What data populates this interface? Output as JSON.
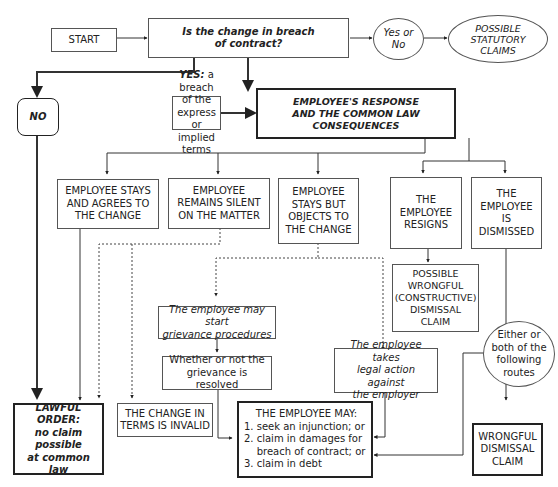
{
  "diagram": {
    "nodes": {
      "start": "START",
      "question": "Is the change in breach\nof contract?",
      "yes_or_no": "Yes or\nNo",
      "statutory": "POSSIBLE\nSTATUTORY\nCLAIMS",
      "no": "NO",
      "yes_prefix": "YES:",
      "yes_text": " a breach of the express\nor implied terms",
      "response": "EMPLOYEE'S RESPONSE\nAND THE COMMON LAW\nCONSEQUENCES",
      "agrees": "EMPLOYEE STAYS\nAND AGREES TO\nTHE CHANGE",
      "silent": "EMPLOYEE\nREMAINS SILENT\nON THE MATTER",
      "objects": "EMPLOYEE\nSTAYS BUT\nOBJECTS TO\nTHE CHANGE",
      "resigns": "THE\nEMPLOYEE\nRESIGNS",
      "dismissed": "THE\nEMPLOYEE\nIS\nDISMISSED",
      "constructive": "POSSIBLE\nWRONGFUL\n(CONSTRUCTIVE)\nDISMISSAL\nCLAIM",
      "grievance": "The employee may start\ngrievance procedures",
      "resolved": "Whether or not the\ngrievance is resolved",
      "legal_action": "The employee takes\nlegal action against\nthe employer",
      "routes": "Either or\nboth of the\nfollowing\nroutes",
      "lawful_title": "LAWFUL\nORDER:",
      "lawful_text": "no claim possible\nat common law",
      "invalid": "THE CHANGE IN\nTERMS IS INVALID",
      "may_title": "THE EMPLOYEE MAY:",
      "may_items": [
        "1. seek an injunction; or",
        "2. claim in damages for",
        "    breach of contract; or",
        "3. claim in debt"
      ],
      "wrongful": "WRONGFUL\nDISMISSAL\nCLAIM"
    }
  }
}
